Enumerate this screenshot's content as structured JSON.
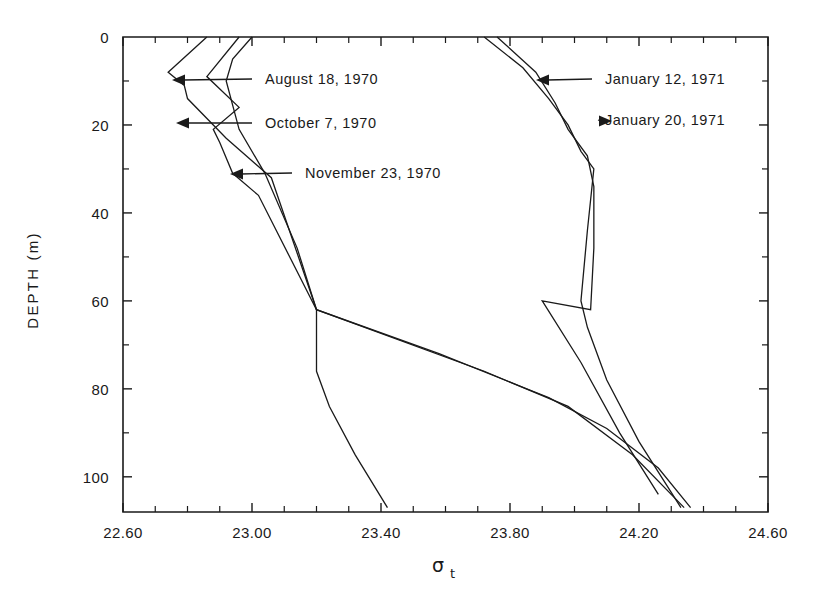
{
  "chart_data": {
    "type": "line",
    "title": "",
    "xlabel": "σt",
    "ylabel": "DEPTH (m)",
    "xlim": [
      22.6,
      24.6
    ],
    "ylim": [
      0,
      108
    ],
    "y_inverted": true,
    "grid": false,
    "legend_position": "inline-annotations",
    "x_ticks": [
      "22.60",
      "23.00",
      "23.40",
      "23.80",
      "24.20",
      "24.60"
    ],
    "x_tick_values": [
      22.6,
      23.0,
      23.4,
      23.8,
      24.2,
      24.6
    ],
    "x_minor_step": 0.1,
    "y_ticks": [
      "0",
      "20",
      "40",
      "60",
      "80",
      "100"
    ],
    "y_tick_values": [
      0,
      20,
      40,
      60,
      80,
      100
    ],
    "y_minor_step": 10,
    "series": [
      {
        "name": "August 18, 1970",
        "x": [
          22.86,
          22.74,
          22.79,
          22.8,
          22.88,
          22.92,
          23.06,
          23.2,
          23.2,
          23.24,
          23.32,
          23.42
        ],
        "y": [
          0,
          8,
          11,
          14,
          20,
          23,
          32,
          62,
          76,
          84,
          95,
          107
        ]
      },
      {
        "name": "October 7, 1970",
        "x": [
          22.96,
          22.86,
          22.96,
          22.88,
          22.9,
          22.94,
          23.02,
          23.2,
          23.72,
          23.98,
          24.18,
          24.34
        ],
        "y": [
          0,
          9,
          16,
          21,
          24,
          31,
          36,
          62,
          76,
          84,
          95,
          107
        ]
      },
      {
        "name": "November 23, 1970",
        "x": [
          23.0,
          22.94,
          22.92,
          22.96,
          23.04,
          23.14,
          23.2,
          23.58,
          23.92,
          24.1,
          24.26,
          24.36
        ],
        "y": [
          0,
          5,
          10,
          21,
          31,
          48,
          62,
          72,
          82,
          89,
          98,
          107
        ]
      },
      {
        "name": "January 12, 1971",
        "x": [
          23.72,
          23.84,
          23.92,
          23.98,
          24.02,
          24.06,
          24.04,
          24.02,
          24.04,
          24.1,
          24.2,
          24.33
        ],
        "y": [
          0,
          7,
          14,
          20,
          26,
          30,
          44,
          60,
          66,
          78,
          92,
          107
        ]
      },
      {
        "name": "January 20, 1971",
        "x": [
          23.76,
          23.88,
          23.94,
          23.98,
          24.04,
          24.06,
          24.06,
          24.05,
          23.9,
          24.02,
          24.14,
          24.26
        ],
        "y": [
          0,
          8,
          15,
          21,
          27,
          34,
          48,
          62,
          60,
          74,
          90,
          104
        ]
      }
    ],
    "annotations": [
      {
        "label": "August 18, 1970",
        "side": "right",
        "text_x": 265,
        "text_y": 84,
        "tip_x": 172,
        "tip_y": 80,
        "elbow_x": 252
      },
      {
        "label": "October 7, 1970",
        "side": "right",
        "text_x": 265,
        "text_y": 128,
        "tip_x": 176,
        "tip_y": 123,
        "elbow_x": 252
      },
      {
        "label": "November 23, 1970",
        "side": "right",
        "text_x": 305,
        "text_y": 178,
        "tip_x": 230,
        "tip_y": 174,
        "elbow_x": 292
      },
      {
        "label": "January 12, 1971",
        "side": "right",
        "text_x": 605,
        "text_y": 84,
        "tip_x": 536,
        "tip_y": 80,
        "elbow_x": 592
      },
      {
        "label": "January 20, 1971",
        "side": "right",
        "text_x": 605,
        "text_y": 125,
        "tip_x": 612,
        "tip_y": 121,
        "elbow_x": 598
      }
    ]
  },
  "axes": {
    "y_axis_title": "DEPTH (m)",
    "x_axis_symbol": "σ",
    "x_axis_subscript": "t"
  }
}
